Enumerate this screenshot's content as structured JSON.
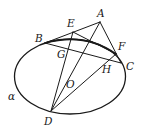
{
  "diagram": {
    "type": "geometry-figure",
    "ellipse": {
      "name": "α",
      "cx": 70,
      "cy": 76.5,
      "rx": 55.5,
      "ry": 37.5
    },
    "points": {
      "A": {
        "label": "A",
        "x": 100,
        "y": 22,
        "lx": 97,
        "ly": 17
      },
      "E": {
        "label": "E",
        "x": 73,
        "y": 32,
        "lx": 67,
        "ly": 27
      },
      "B": {
        "label": "B",
        "x": 45,
        "y": 43,
        "lx": 35,
        "ly": 42
      },
      "F": {
        "label": "F",
        "x": 116,
        "y": 54,
        "lx": 118,
        "ly": 50
      },
      "C": {
        "label": "C",
        "x": 121,
        "y": 63,
        "lx": 126,
        "ly": 70
      },
      "G": {
        "label": "G",
        "x": 67,
        "y": 49,
        "lx": 57,
        "ly": 58
      },
      "H": {
        "label": "H",
        "x": 106,
        "y": 59,
        "lx": 102,
        "ly": 73
      },
      "O": {
        "label": "O",
        "lx": 66,
        "ly": 88
      },
      "D": {
        "label": "D",
        "x": 51,
        "y": 111,
        "lx": 44,
        "ly": 125
      }
    },
    "plane_label": "α",
    "segments": [
      "AB",
      "AC",
      "BC",
      "EF",
      "ED",
      "AD",
      "FD"
    ]
  }
}
